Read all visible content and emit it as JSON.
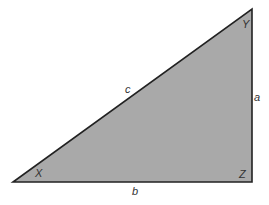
{
  "diagram": {
    "type": "right-triangle",
    "fill_color": "#a9a9a9",
    "stroke_color": "#222222",
    "vertices": {
      "X": "X",
      "Y": "Y",
      "Z": "Z"
    },
    "sides": {
      "a": "a",
      "b": "b",
      "c": "c"
    }
  }
}
